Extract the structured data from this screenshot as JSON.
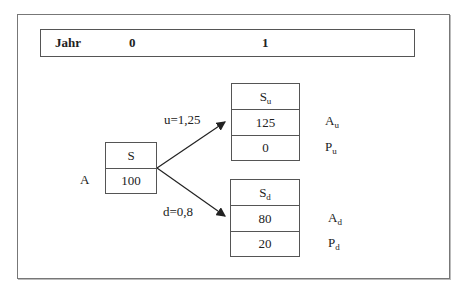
{
  "header": {
    "label": "Jahr",
    "year0": "0",
    "year1": "1"
  },
  "root": {
    "state_label": "A",
    "title": "S",
    "value": "100"
  },
  "up": {
    "edge_label": "u=1,25",
    "title_base": "S",
    "title_sub": "u",
    "stock_value": "125",
    "put_value": "0",
    "stock_label_base": "A",
    "stock_label_sub": "u",
    "put_label_base": "P",
    "put_label_sub": "u"
  },
  "down": {
    "edge_label": "d=0,8",
    "title_base": "S",
    "title_sub": "d",
    "stock_value": "80",
    "put_value": "20",
    "stock_label_base": "A",
    "stock_label_sub": "d",
    "put_label_base": "P",
    "put_label_sub": "d"
  }
}
